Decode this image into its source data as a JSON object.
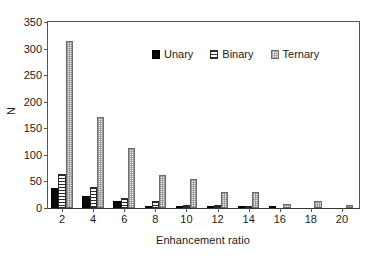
{
  "chart_data": {
    "type": "bar",
    "title": "",
    "xlabel": "Enhancement ratio",
    "ylabel": "N",
    "categories": [
      "2",
      "4",
      "6",
      "8",
      "10",
      "12",
      "14",
      "16",
      "18",
      "20"
    ],
    "series": [
      {
        "name": "Unary",
        "values": [
          37,
          22,
          13,
          1,
          1,
          1,
          1,
          1,
          0,
          0
        ]
      },
      {
        "name": "Binary",
        "values": [
          64,
          39,
          19,
          13,
          6,
          5,
          1,
          0,
          0,
          0
        ]
      },
      {
        "name": "Ternary",
        "values": [
          314,
          172,
          112,
          63,
          54,
          31,
          30,
          7,
          14,
          5
        ]
      }
    ],
    "ylim": [
      0,
      350
    ],
    "yticks": [
      0,
      50,
      100,
      150,
      200,
      250,
      300,
      350
    ],
    "xticks": [
      "2",
      "4",
      "6",
      "8",
      "10",
      "12",
      "14",
      "16",
      "18",
      "20"
    ],
    "grid": false,
    "legend_position": "upper center",
    "legend_entries": [
      "Unary",
      "Binary",
      "Ternary"
    ],
    "series_fills": [
      "solid-black",
      "horizontal-lines",
      "light-dotted"
    ]
  },
  "colors": {
    "unary": "#0a0a0a",
    "binary": "#2b2b2b",
    "ternary": "#e9e9e9",
    "axis": "#555555",
    "text": "#1a1a1a",
    "background": "#ffffff"
  }
}
